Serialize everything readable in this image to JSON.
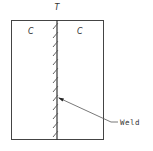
{
  "diagram": {
    "top_label": "T",
    "left_region_label": "C",
    "right_region_label": "C",
    "callout_label": "Weld",
    "colors": {
      "stroke": "#444444",
      "text": "#333333",
      "background": "#ffffff"
    },
    "frame": {
      "x": 11,
      "y": 20,
      "width": 93,
      "height": 120
    },
    "weld_line_x": 57,
    "hatch_count": 13
  }
}
